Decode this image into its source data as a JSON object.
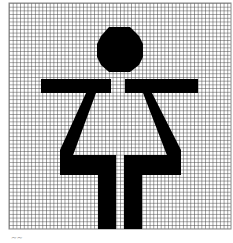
{
  "figure": {
    "grid": {
      "x": 9,
      "y": 3,
      "width": 222,
      "height": 226,
      "cell": 3.7,
      "line_color": "#555555",
      "background": "#ffffff"
    },
    "shape_color": "#000000",
    "icon_semantic": "woman-restroom-icon"
  },
  "caption": "~~"
}
